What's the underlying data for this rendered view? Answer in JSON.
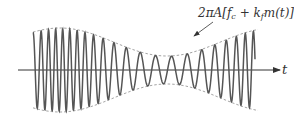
{
  "diagram": {
    "title": "",
    "envelope_label": "2πA[f_c + k_f m(t)]",
    "envelope_label_parts": {
      "prefix": "2πA[",
      "f": "f",
      "c_sub": "c",
      "plus": " + ",
      "k": "k",
      "f_sub": "f",
      "mid": "m(t)]"
    },
    "axis_label": "t",
    "colors": {
      "waveform": "#555555",
      "envelope": "#9a9a9a",
      "axis": "#333333",
      "background": "#ffffff"
    }
  }
}
